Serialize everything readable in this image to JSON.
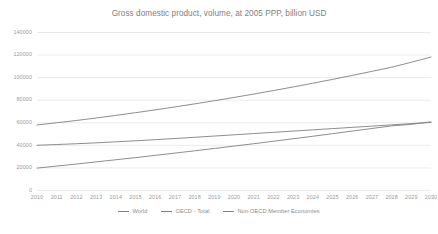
{
  "chart_data": {
    "type": "line",
    "title": "Gross domestic product, volume, at 2005 PPP, billion USD",
    "xlabel": "",
    "ylabel": "",
    "x": [
      2010,
      2011,
      2012,
      2013,
      2014,
      2015,
      2016,
      2017,
      2018,
      2019,
      2020,
      2021,
      2022,
      2023,
      2024,
      2025,
      2026,
      2027,
      2028,
      2029,
      2030
    ],
    "xtick_labels": [
      "2010",
      "2011",
      "2012",
      "2013",
      "2014",
      "2015",
      "2016",
      "2017",
      "2018",
      "2019",
      "2020",
      "2021",
      "2022",
      "2023",
      "2024",
      "2025",
      "2026",
      "2027",
      "2028",
      "2029",
      "2030"
    ],
    "ytick_labels": [
      "0",
      "20000",
      "40000",
      "60000",
      "80000",
      "100000",
      "120000",
      "140000"
    ],
    "yticks": [
      0,
      20000,
      40000,
      60000,
      80000,
      100000,
      120000,
      140000
    ],
    "ylim": [
      0,
      140000
    ],
    "xlim": [
      2010,
      2030
    ],
    "grid": "horizontal",
    "legend_position": "bottom",
    "series": [
      {
        "name": "World",
        "color": "#808080",
        "values": [
          57600,
          59600,
          61600,
          63800,
          66100,
          68500,
          71000,
          73600,
          76300,
          79100,
          82000,
          85000,
          88100,
          91300,
          94600,
          98000,
          101500,
          105100,
          108800,
          113200,
          117800
        ]
      },
      {
        "name": "OECD - Total",
        "color": "#808080",
        "values": [
          39600,
          40300,
          41000,
          41800,
          42700,
          43600,
          44600,
          45600,
          46700,
          47800,
          48900,
          50000,
          51100,
          52200,
          53300,
          54400,
          55500,
          56600,
          57700,
          58800,
          59900
        ]
      },
      {
        "name": "Non-OECD Member Economies",
        "color": "#808080",
        "values": [
          19400,
          21200,
          23000,
          24900,
          26800,
          28700,
          30700,
          32700,
          34700,
          36800,
          38900,
          41000,
          43200,
          45400,
          47600,
          49900,
          52200,
          54500,
          56800,
          58200,
          60400
        ]
      }
    ]
  },
  "legend": {
    "items": [
      {
        "label": "World"
      },
      {
        "label": "OECD - Total"
      },
      {
        "label": "Non-OECD Member Economies"
      }
    ]
  }
}
